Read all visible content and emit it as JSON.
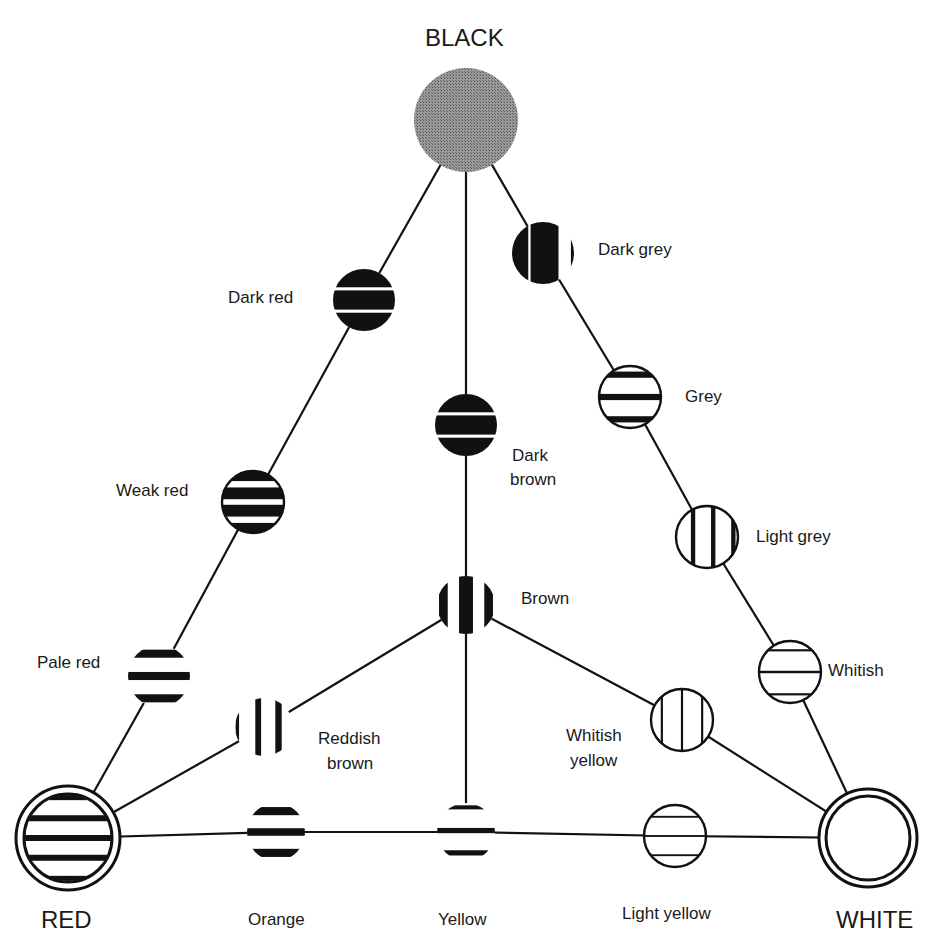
{
  "title": "BLACK",
  "colors": {
    "ink": "#111111",
    "grey_fill": "#8a8a8a",
    "paper": "#ffffff"
  },
  "corners": [
    {
      "id": "black",
      "label": "BLACK",
      "cx": 466,
      "cy": 120,
      "r": 52,
      "style": "solid-grey"
    },
    {
      "id": "red",
      "label": "RED",
      "cx": 68,
      "cy": 838,
      "r": 52,
      "style": "double-ring-hstripes"
    },
    {
      "id": "white",
      "label": "WHITE",
      "cx": 868,
      "cy": 838,
      "r": 49,
      "style": "double-ring-empty"
    }
  ],
  "nodes": [
    {
      "id": "dark-red",
      "label": "Dark red",
      "cx": 364,
      "cy": 300,
      "r": 31,
      "pattern": "h-dark",
      "label_x": 228,
      "label_y": 288
    },
    {
      "id": "weak-red",
      "label": "Weak red",
      "cx": 253,
      "cy": 502,
      "r": 31,
      "pattern": "h-medium",
      "label_x": 116,
      "label_y": 481
    },
    {
      "id": "pale-red",
      "label": "Pale red",
      "cx": 159,
      "cy": 676,
      "r": 31,
      "pattern": "h-pale-open",
      "label_x": 37,
      "label_y": 653
    },
    {
      "id": "dark-brown",
      "label": "Dark brown",
      "cx": 466,
      "cy": 425,
      "r": 31,
      "pattern": "h-dark",
      "label_x": 515,
      "label_y": 444,
      "multiline": [
        "Dark",
        "brown"
      ]
    },
    {
      "id": "brown",
      "label": "Brown",
      "cx": 466,
      "cy": 605,
      "r": 29,
      "pattern": "v-brown",
      "label_x": 521,
      "label_y": 589
    },
    {
      "id": "reddish-brown",
      "label": "Reddish brown",
      "cx": 264,
      "cy": 727,
      "r": 29,
      "pattern": "v-reddish",
      "label_x": 318,
      "label_y": 727,
      "multiline": [
        "Reddish",
        "brown"
      ]
    },
    {
      "id": "orange",
      "label": "Orange",
      "cx": 276,
      "cy": 832,
      "r": 29,
      "pattern": "h-orange",
      "label_x": 248,
      "label_y": 908
    },
    {
      "id": "yellow",
      "label": "Yellow",
      "cx": 466,
      "cy": 832,
      "r": 29,
      "pattern": "h-yellow",
      "label_x": 437,
      "label_y": 908
    },
    {
      "id": "light-yellow",
      "label": "Light yellow",
      "cx": 675,
      "cy": 836,
      "r": 31,
      "pattern": "h-thin-ring",
      "label_x": 622,
      "label_y": 903
    },
    {
      "id": "dark-grey",
      "label": "Dark grey",
      "cx": 543,
      "cy": 253,
      "r": 31,
      "pattern": "v-darkgrey",
      "label_x": 598,
      "label_y": 240
    },
    {
      "id": "grey",
      "label": "Grey",
      "cx": 630,
      "cy": 397,
      "r": 31,
      "pattern": "h-grey",
      "label_x": 685,
      "label_y": 387
    },
    {
      "id": "light-grey",
      "label": "Light grey",
      "cx": 707,
      "cy": 537,
      "r": 31,
      "pattern": "v-lightgrey",
      "label_x": 756,
      "label_y": 527
    },
    {
      "id": "whitish",
      "label": "Whitish",
      "cx": 790,
      "cy": 672,
      "r": 31,
      "pattern": "h-whitish",
      "label_x": 828,
      "label_y": 661
    },
    {
      "id": "whitish-yellow",
      "label": "Whitish yellow",
      "cx": 682,
      "cy": 720,
      "r": 31,
      "pattern": "v-whitishyellow",
      "label_x": 566,
      "label_y": 725,
      "multiline": [
        "Whitish",
        "yellow"
      ]
    }
  ],
  "edges": [
    [
      "black",
      "dark-red"
    ],
    [
      "dark-red",
      "weak-red"
    ],
    [
      "weak-red",
      "pale-red"
    ],
    [
      "pale-red",
      "red"
    ],
    [
      "black",
      "dark-brown"
    ],
    [
      "dark-brown",
      "brown"
    ],
    [
      "brown",
      "yellow"
    ],
    [
      "black",
      "dark-grey"
    ],
    [
      "dark-grey",
      "grey"
    ],
    [
      "grey",
      "light-grey"
    ],
    [
      "light-grey",
      "whitish"
    ],
    [
      "whitish",
      "white"
    ],
    [
      "red",
      "reddish-brown"
    ],
    [
      "reddish-brown",
      "brown"
    ],
    [
      "brown",
      "whitish-yellow"
    ],
    [
      "whitish-yellow",
      "white"
    ],
    [
      "red",
      "orange"
    ],
    [
      "orange",
      "yellow"
    ],
    [
      "yellow",
      "light-yellow"
    ],
    [
      "light-yellow",
      "white"
    ]
  ],
  "labels": {
    "black": "BLACK",
    "red": "RED",
    "white": "WHITE",
    "dark_red": "Dark red",
    "weak_red": "Weak red",
    "pale_red": "Pale red",
    "dark_brown_1": "Dark",
    "dark_brown_2": "brown",
    "brown": "Brown",
    "reddish_brown_1": "Reddish",
    "reddish_brown_2": "brown",
    "orange": "Orange",
    "yellow": "Yellow",
    "light_yellow": "Light yellow",
    "dark_grey": "Dark grey",
    "grey": "Grey",
    "light_grey": "Light grey",
    "whitish": "Whitish",
    "whitish_yellow_1": "Whitish",
    "whitish_yellow_2": "yellow"
  }
}
